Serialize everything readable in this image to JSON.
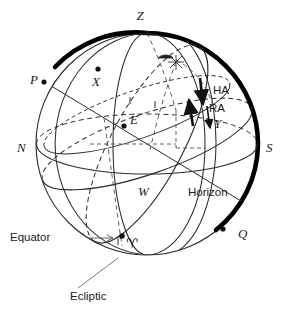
{
  "figure": {
    "colors": {
      "ink": "#1a1a1a",
      "line": "#2b2b2b",
      "thick_meridian": "#000000",
      "background": "#ffffff"
    }
  },
  "labels": {
    "zenith": "Z",
    "pole": "P",
    "star": "X",
    "centre": "E",
    "north": "N",
    "south": "S",
    "west": "W",
    "nadir_point": "Q",
    "hour_angle": "HA",
    "right_ascension": "RA",
    "star_foot": "Y",
    "horizon": "Horizon",
    "equator": "Equator",
    "ecliptic": "Ecliptic",
    "aries": "♈",
    "star_symbol": "✳"
  },
  "markers": {
    "pole_dot": "P",
    "star_dot": "X",
    "centre_dot": "E",
    "aries_dot": "♈",
    "quadrant_dot": "Q",
    "zenith_dot": "Z"
  },
  "annotations": [
    {
      "name": "horizon-circle",
      "label": "Horizon"
    },
    {
      "name": "equator-circle",
      "label": "Equator"
    },
    {
      "name": "ecliptic-circle",
      "label": "Ecliptic"
    },
    {
      "name": "hour-angle-arrow",
      "label": "HA"
    },
    {
      "name": "right-ascension-arrow",
      "label": "RA"
    }
  ]
}
